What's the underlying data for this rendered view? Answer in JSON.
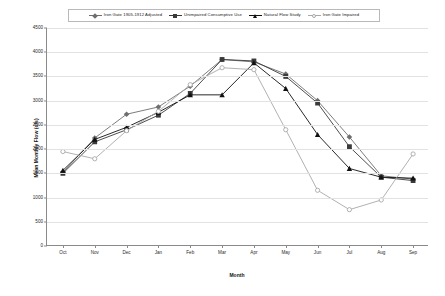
{
  "chart_data": {
    "type": "line",
    "title": "",
    "xlabel": "Month",
    "ylabel": "Mean Monthly Flow (cfs)",
    "categories": [
      "Oct",
      "Nov",
      "Dec",
      "Jan",
      "Feb",
      "Mar",
      "Apr",
      "May",
      "Jun",
      "Jul",
      "Aug",
      "Sep"
    ],
    "ylim": [
      0,
      4500
    ],
    "ytick_step": 500,
    "yticks": [
      0,
      500,
      1000,
      1500,
      2000,
      2500,
      3000,
      3500,
      4000,
      4500
    ],
    "grid": true,
    "legend_position": "top",
    "series": [
      {
        "name": "Iron Gate 1905-1912 Adjusted",
        "color": "#6e6e6e",
        "marker": "diamond",
        "values": [
          1520,
          2230,
          2720,
          2870,
          3300,
          3850,
          3800,
          3550,
          3000,
          2250,
          1450,
          1380
        ]
      },
      {
        "name": "Unimpaired Consumptive Use",
        "color": "#3a3a3a",
        "marker": "square",
        "values": [
          1500,
          2150,
          2400,
          2700,
          3150,
          3850,
          3820,
          3500,
          2950,
          2050,
          1420,
          1350
        ]
      },
      {
        "name": "Natural Flow Study",
        "color": "#111111",
        "marker": "triangle",
        "values": [
          1560,
          2200,
          2450,
          2760,
          3120,
          3120,
          3780,
          3250,
          2300,
          1600,
          1420,
          1400
        ]
      },
      {
        "name": "Iron Gate Impaired",
        "color": "#a8a8a8",
        "marker": "circle",
        "values": [
          1950,
          1800,
          2380,
          2780,
          3330,
          3680,
          3640,
          2400,
          1150,
          750,
          950,
          1900
        ]
      }
    ]
  }
}
